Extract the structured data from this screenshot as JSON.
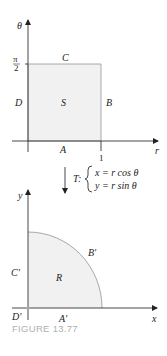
{
  "figure": {
    "caption": "FIGURE 13.77",
    "colors": {
      "axis": "#333333",
      "region_edge": "#a8a8a8",
      "region_fill": "#f1f1f1",
      "caption": "#b0b0b0"
    }
  },
  "top_plot": {
    "vertical_axis_label": "θ",
    "horizontal_axis_label": "r",
    "vertical_tick_label_num": "π",
    "vertical_tick_label_den": "2",
    "horizontal_tick_label": "1",
    "region_label": "S",
    "edge_labels": {
      "bottom": "A",
      "right": "B",
      "top": "C",
      "left": "D"
    }
  },
  "transformation": {
    "name": "T:",
    "equation_x": "x = r cos θ",
    "equation_y": "y = r sin θ"
  },
  "bottom_plot": {
    "vertical_axis_label": "y",
    "horizontal_axis_label": "x",
    "region_label": "R",
    "edge_labels": {
      "bottom": "A′",
      "arc": "B′",
      "left": "C′",
      "origin": "D′"
    }
  }
}
